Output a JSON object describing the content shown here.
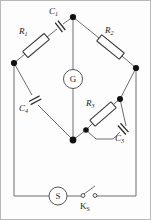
{
  "figure": {
    "name": "ac-bridge-circuit"
  },
  "components": {
    "r1": {
      "label": "R",
      "sub": "1",
      "type": "resistor",
      "position": "top-left-arm"
    },
    "r2": {
      "label": "R",
      "sub": "2",
      "type": "resistor",
      "position": "top-right-arm"
    },
    "r3": {
      "label": "R",
      "sub": "3",
      "type": "resistor",
      "position": "bottom-right-arm"
    },
    "c1": {
      "label": "C",
      "sub": "1",
      "type": "capacitor",
      "position": "top-left-arm-series"
    },
    "c3": {
      "label": "C",
      "sub": "3",
      "type": "capacitor",
      "position": "bottom-right-arm-parallel"
    },
    "c4": {
      "label": "C",
      "sub": "4",
      "type": "capacitor",
      "position": "bottom-left-arm"
    },
    "galvanometer": {
      "label": "G",
      "type": "meter",
      "position": "bridge-center"
    },
    "source": {
      "label": "S",
      "type": "source",
      "position": "bottom-branch"
    },
    "switch": {
      "label": "K",
      "sub": "S",
      "type": "switch",
      "position": "bottom-branch-right"
    }
  },
  "colors": {
    "wire": "#6f6f6f",
    "component_outline": "#3b3b3b",
    "node": "#111111",
    "background": "#fdfdfd",
    "frame": "#b9b9b9"
  }
}
